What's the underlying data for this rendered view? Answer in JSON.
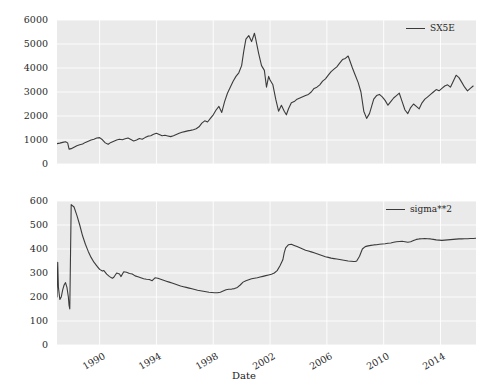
{
  "figure": {
    "background_color": "#ffffff",
    "plot_area_color": "#eaeaea",
    "grid_color": "#ffffff",
    "line_color": "#3b3b3b"
  },
  "xlabel": "Date",
  "panels": [
    {
      "name": "top-panel",
      "legend_label": "SX5E",
      "yticks": [
        "0",
        "1000",
        "2000",
        "3000",
        "4000",
        "5000",
        "6000"
      ],
      "xticks": []
    },
    {
      "name": "bottom-panel",
      "legend_label": "sigma**2",
      "yticks": [
        "0",
        "100",
        "200",
        "300",
        "400",
        "500",
        "600"
      ],
      "xticks": [
        "1990",
        "1994",
        "1998",
        "2002",
        "2006",
        "2010",
        "2014"
      ]
    }
  ],
  "chart_data": [
    {
      "type": "line",
      "title": "",
      "xlabel": "",
      "ylabel": "",
      "panel": "top",
      "grid": true,
      "legend_position": "upper right",
      "xlim": [
        1987.0,
        2016.5
      ],
      "ylim": [
        0,
        6000
      ],
      "xticks": [
        1990,
        1994,
        1998,
        2002,
        2006,
        2010,
        2014
      ],
      "yticks": [
        0,
        1000,
        2000,
        3000,
        4000,
        5000,
        6000
      ],
      "series": [
        {
          "name": "SX5E",
          "x": [
            1987.0,
            1987.2,
            1987.4,
            1987.6,
            1987.75,
            1987.85,
            1988.0,
            1988.2,
            1988.4,
            1988.6,
            1988.8,
            1989.0,
            1989.2,
            1989.4,
            1989.6,
            1989.8,
            1990.0,
            1990.2,
            1990.4,
            1990.6,
            1990.8,
            1991.0,
            1991.2,
            1991.4,
            1991.6,
            1991.8,
            1992.0,
            1992.2,
            1992.4,
            1992.6,
            1992.8,
            1993.0,
            1993.2,
            1993.4,
            1993.6,
            1993.8,
            1994.0,
            1994.2,
            1994.4,
            1994.6,
            1994.8,
            1995.0,
            1995.2,
            1995.4,
            1995.6,
            1995.8,
            1996.0,
            1996.2,
            1996.4,
            1996.6,
            1996.8,
            1997.0,
            1997.2,
            1997.4,
            1997.6,
            1997.8,
            1998.0,
            1998.2,
            1998.4,
            1998.6,
            1998.8,
            1999.0,
            1999.2,
            1999.4,
            1999.6,
            1999.8,
            2000.0,
            2000.15,
            2000.3,
            2000.5,
            2000.7,
            2000.9,
            2001.0,
            2001.2,
            2001.4,
            2001.6,
            2001.75,
            2001.9,
            2002.0,
            2002.2,
            2002.4,
            2002.6,
            2002.8,
            2003.0,
            2003.15,
            2003.3,
            2003.5,
            2003.7,
            2003.9,
            2004.1,
            2004.3,
            2004.5,
            2004.7,
            2004.9,
            2005.1,
            2005.3,
            2005.5,
            2005.7,
            2005.9,
            2006.1,
            2006.3,
            2006.5,
            2006.7,
            2006.9,
            2007.1,
            2007.3,
            2007.5,
            2007.65,
            2007.8,
            2008.0,
            2008.2,
            2008.4,
            2008.6,
            2008.8,
            2009.0,
            2009.15,
            2009.3,
            2009.5,
            2009.7,
            2009.9,
            2010.1,
            2010.3,
            2010.5,
            2010.7,
            2010.9,
            2011.1,
            2011.3,
            2011.5,
            2011.7,
            2011.9,
            2012.1,
            2012.3,
            2012.5,
            2012.7,
            2012.9,
            2013.1,
            2013.3,
            2013.5,
            2013.7,
            2013.9,
            2014.1,
            2014.3,
            2014.5,
            2014.7,
            2014.9,
            2015.1,
            2015.3,
            2015.5,
            2015.7,
            2015.9,
            2016.1,
            2016.3,
            2016.5
          ],
          "y": [
            850,
            870,
            900,
            930,
            880,
            620,
            640,
            700,
            760,
            800,
            830,
            900,
            950,
            1000,
            1030,
            1080,
            1100,
            1010,
            880,
            820,
            900,
            950,
            1000,
            1030,
            1010,
            1050,
            1080,
            1020,
            960,
            1000,
            1060,
            1030,
            1100,
            1160,
            1180,
            1240,
            1280,
            1230,
            1180,
            1200,
            1170,
            1140,
            1180,
            1230,
            1280,
            1320,
            1350,
            1380,
            1400,
            1430,
            1470,
            1550,
            1700,
            1800,
            1750,
            1900,
            2050,
            2250,
            2400,
            2150,
            2600,
            2950,
            3200,
            3450,
            3650,
            3800,
            4100,
            4700,
            5200,
            5350,
            5100,
            5450,
            5180,
            4600,
            4100,
            3900,
            3200,
            3650,
            3500,
            3300,
            2700,
            2200,
            2450,
            2200,
            2050,
            2300,
            2550,
            2600,
            2700,
            2750,
            2800,
            2850,
            2900,
            3000,
            3150,
            3200,
            3300,
            3450,
            3550,
            3700,
            3850,
            3950,
            4050,
            4200,
            4350,
            4400,
            4500,
            4250,
            4000,
            3700,
            3400,
            3000,
            2200,
            1900,
            2100,
            2400,
            2700,
            2850,
            2900,
            2800,
            2650,
            2450,
            2600,
            2750,
            2850,
            2950,
            2600,
            2250,
            2100,
            2350,
            2500,
            2400,
            2300,
            2550,
            2700,
            2800,
            2900,
            3000,
            3100,
            3050,
            3150,
            3250,
            3300,
            3200,
            3450,
            3700,
            3600,
            3400,
            3200,
            3050,
            3150,
            3250
          ]
        }
      ]
    },
    {
      "type": "line",
      "title": "",
      "xlabel": "Date",
      "ylabel": "",
      "panel": "bottom",
      "grid": true,
      "legend_position": "upper right",
      "xlim": [
        1987.0,
        2016.5
      ],
      "ylim": [
        0,
        600
      ],
      "xticks": [
        1990,
        1994,
        1998,
        2002,
        2006,
        2010,
        2014
      ],
      "yticks": [
        0,
        100,
        200,
        300,
        400,
        500,
        600
      ],
      "series": [
        {
          "name": "sigma**2",
          "x": [
            1987.0,
            1987.05,
            1987.1,
            1987.2,
            1987.3,
            1987.4,
            1987.5,
            1987.6,
            1987.7,
            1987.8,
            1987.85,
            1987.9,
            1988.0,
            1988.2,
            1988.4,
            1988.6,
            1988.8,
            1989.0,
            1989.2,
            1989.4,
            1989.6,
            1989.8,
            1990.0,
            1990.2,
            1990.3,
            1990.5,
            1990.7,
            1990.9,
            1991.0,
            1991.2,
            1991.4,
            1991.5,
            1991.7,
            1991.9,
            1992.1,
            1992.3,
            1992.5,
            1992.7,
            1992.9,
            1993.1,
            1993.3,
            1993.5,
            1993.7,
            1993.9,
            1994.1,
            1994.3,
            1994.5,
            1994.7,
            1994.9,
            1995.1,
            1995.3,
            1995.5,
            1995.7,
            1995.9,
            1996.1,
            1996.3,
            1996.5,
            1996.7,
            1996.9,
            1997.1,
            1997.3,
            1997.5,
            1997.7,
            1997.9,
            1998.1,
            1998.3,
            1998.5,
            1998.7,
            1998.9,
            1999.1,
            1999.3,
            1999.5,
            1999.7,
            1999.9,
            2000.1,
            2000.3,
            2000.5,
            2000.7,
            2000.9,
            2001.1,
            2001.3,
            2001.5,
            2001.7,
            2001.9,
            2002.1,
            2002.3,
            2002.5,
            2002.7,
            2002.9,
            2003.0,
            2003.1,
            2003.3,
            2003.5,
            2003.7,
            2003.9,
            2004.1,
            2004.3,
            2004.5,
            2004.7,
            2004.9,
            2005.1,
            2005.3,
            2005.5,
            2005.7,
            2005.9,
            2006.1,
            2006.3,
            2006.5,
            2006.7,
            2006.9,
            2007.1,
            2007.3,
            2007.5,
            2007.7,
            2007.9,
            2008.0,
            2008.1,
            2008.3,
            2008.5,
            2008.7,
            2008.9,
            2009.1,
            2009.3,
            2009.5,
            2009.7,
            2009.9,
            2010.1,
            2010.3,
            2010.5,
            2010.7,
            2010.9,
            2011.1,
            2011.3,
            2011.5,
            2011.7,
            2011.9,
            2012.1,
            2012.3,
            2012.5,
            2012.7,
            2012.9,
            2013.1,
            2013.3,
            2013.5,
            2013.7,
            2013.9,
            2014.1,
            2014.3,
            2014.5,
            2014.7,
            2014.9,
            2015.1,
            2015.3,
            2015.5,
            2015.7,
            2015.9,
            2016.1,
            2016.3,
            2016.5
          ],
          "y": [
            200,
            345,
            240,
            190,
            200,
            230,
            250,
            260,
            240,
            200,
            165,
            150,
            585,
            575,
            540,
            500,
            455,
            420,
            390,
            365,
            345,
            330,
            315,
            308,
            310,
            295,
            285,
            278,
            282,
            300,
            296,
            285,
            305,
            303,
            298,
            296,
            288,
            284,
            280,
            276,
            274,
            273,
            268,
            280,
            278,
            274,
            270,
            266,
            262,
            258,
            254,
            250,
            246,
            243,
            240,
            237,
            234,
            231,
            228,
            226,
            224,
            222,
            220,
            219,
            218,
            218,
            220,
            225,
            230,
            232,
            233,
            235,
            240,
            250,
            262,
            268,
            272,
            276,
            278,
            280,
            283,
            286,
            289,
            292,
            295,
            300,
            310,
            330,
            355,
            385,
            405,
            418,
            420,
            415,
            410,
            405,
            400,
            395,
            392,
            388,
            384,
            380,
            376,
            372,
            368,
            365,
            362,
            360,
            358,
            356,
            354,
            352,
            350,
            349,
            348,
            348,
            350,
            370,
            400,
            410,
            413,
            415,
            417,
            418,
            420,
            421,
            422,
            424,
            425,
            428,
            430,
            431,
            432,
            430,
            428,
            430,
            435,
            440,
            442,
            443,
            444,
            443,
            442,
            440,
            438,
            437,
            436,
            437,
            438,
            439,
            440,
            441,
            442,
            442,
            443,
            443,
            444,
            444,
            445,
            445,
            445
          ]
        }
      ]
    }
  ]
}
